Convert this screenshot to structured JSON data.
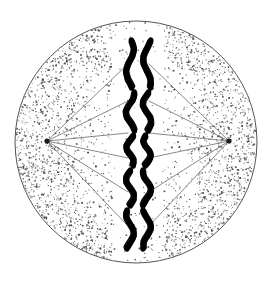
{
  "figure": {
    "caption": "",
    "background_color": "#ffffff",
    "width": 275,
    "height": 283
  },
  "cell": {
    "label": "cell",
    "shape": "circle",
    "center_x": 136,
    "center_y": 142,
    "radius": 122,
    "membrane_color": "#555555",
    "membrane_width": 1,
    "cytoplasm_fill": "#ffffff",
    "stipple_color": "#4a4a4a",
    "stipple_count": 5200,
    "stipple_description": "fine dotted cytoplasm, denser toward the membrane"
  },
  "spindle": {
    "label": "mitotic spindle",
    "fiber_color": "#6b6b6b",
    "fiber_width": 0.8,
    "poles": [
      {
        "name": "left-pole",
        "x": 47,
        "y": 141,
        "color": "#1a1a1a",
        "radius": 2.6
      },
      {
        "name": "right-pole",
        "x": 229,
        "y": 141,
        "color": "#1a1a1a",
        "radius": 2.6
      }
    ],
    "fiber_target_y": [
      64,
      101,
      133,
      158,
      192,
      226
    ],
    "fiber_count": 12
  },
  "chromosomes": {
    "label": "chromosomes aligned on the metaphase plate",
    "color": "#000000",
    "pair_count": 5,
    "strand_count": 10,
    "left_strand_x": 130,
    "right_strand_x": 147,
    "plate_x": 138,
    "rows": [
      {
        "name": "chromosome-pair-1",
        "top": 40,
        "bottom": 88,
        "wave_amplitude": 4.2
      },
      {
        "name": "chromosome-pair-2",
        "top": 92,
        "bottom": 131,
        "wave_amplitude": 4.6
      },
      {
        "name": "chromosome-pair-3",
        "top": 135,
        "bottom": 166,
        "wave_amplitude": 4.0
      },
      {
        "name": "chromosome-pair-4",
        "top": 170,
        "bottom": 206,
        "wave_amplitude": 4.4
      },
      {
        "name": "chromosome-pair-5",
        "top": 210,
        "bottom": 249,
        "wave_amplitude": 4.2
      }
    ]
  },
  "metaphase_plate": {
    "label": "metaphase plate",
    "x": 138,
    "top": 40,
    "bottom": 249
  }
}
